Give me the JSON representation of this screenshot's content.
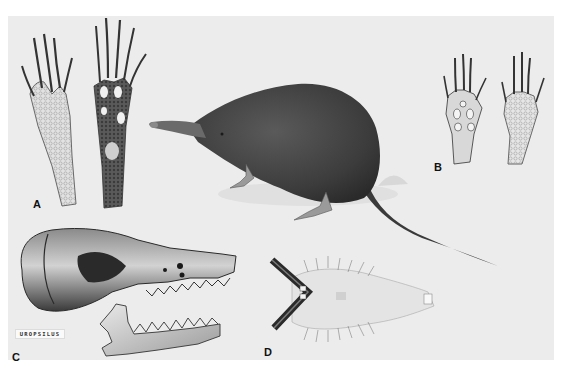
{
  "plate": {
    "background": "#ececec",
    "ink": "#2a2a2a",
    "panels": [
      {
        "id": "A",
        "label": "A",
        "subject": "hind-feet-dorsal-and-plantar"
      },
      {
        "id": "B",
        "label": "B",
        "subject": "fore-feet-plantar-and-dorsal"
      },
      {
        "id": "C",
        "label": "C",
        "subject": "skull-and-mandible-lateral"
      },
      {
        "id": "D",
        "label": "D",
        "subject": "snout-ventral-view"
      }
    ],
    "main_figure": {
      "subject": "shrew-mole-full-body"
    },
    "genus_tag": "UROPSILUS"
  }
}
